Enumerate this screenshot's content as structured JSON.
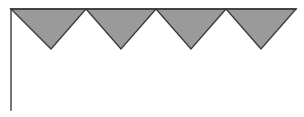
{
  "figure": {
    "name": "sawtooth-triangle-figure",
    "width": 304,
    "height": 117,
    "background_color": "#ffffff",
    "stroke_color": "#3a3a42",
    "fill_color": "#9a9a9a",
    "stroke_width": 1.4,
    "axis": {
      "vertical_line": {
        "x": 11,
        "y_top": 9,
        "y_bottom": 110
      },
      "horizontal_line": {
        "y": 9,
        "x_start": 11,
        "x_end": 296
      }
    },
    "triangle_count": 4,
    "baseline_y": 9,
    "apex_y": 49,
    "base_points_x": [
      11,
      86,
      156,
      226,
      296
    ],
    "apex_points_x": [
      51,
      121,
      191,
      261
    ],
    "triangles": [
      {
        "label": "triangle-1",
        "left_x": 11,
        "right_x": 86,
        "apex_x": 51,
        "top_y": 9,
        "apex_y": 49
      },
      {
        "label": "triangle-2",
        "left_x": 86,
        "right_x": 156,
        "apex_x": 121,
        "top_y": 9,
        "apex_y": 49
      },
      {
        "label": "triangle-3",
        "left_x": 156,
        "right_x": 226,
        "apex_x": 191,
        "top_y": 9,
        "apex_y": 49
      },
      {
        "label": "triangle-4",
        "left_x": 226,
        "right_x": 296,
        "apex_x": 261,
        "top_y": 9,
        "apex_y": 49
      }
    ]
  },
  "chart_data": {
    "type": "area",
    "title": "",
    "subtitle": "",
    "xlabel": "",
    "ylabel": "",
    "grid": false,
    "legend": null,
    "annotations": [],
    "x": [
      11,
      51,
      86,
      121,
      156,
      191,
      226,
      261,
      296
    ],
    "y": [
      9,
      49,
      9,
      49,
      9,
      49,
      9,
      49,
      9
    ],
    "xlim": [
      11,
      296
    ],
    "ylim": [
      9,
      49
    ],
    "x_tick_labels": [],
    "y_tick_labels": [],
    "series": [
      {
        "name": "sawtooth-profile",
        "fill_color": "#9a9a9a",
        "line_color": "#3a3a42",
        "values": [
          9,
          49,
          9,
          49,
          9,
          49,
          9,
          49,
          9
        ]
      }
    ]
  }
}
